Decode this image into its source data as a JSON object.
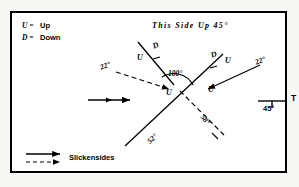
{
  "figure": {
    "title": "This Side Up 45°",
    "background_color": "#ffffff",
    "line_color": "#000000"
  },
  "key": {
    "up_symbol": "U =",
    "up_label": "Up",
    "down_symbol": "D =",
    "down_label": "Down"
  },
  "angles": {
    "center": "100°",
    "left_dashed": "22°",
    "right_solid": "22°",
    "lower_left_solid": "52°",
    "lower_right_dashed": "58°"
  },
  "markers": {
    "upper_left_u": "U",
    "upper_left_d": "D",
    "mid_left_u": "U",
    "upper_right_d": "D",
    "upper_right_u": "U",
    "mid_right_u": "U"
  },
  "scale": {
    "dip_value": "45°",
    "t_symbol": "T"
  },
  "legend": {
    "slickensides_label": "Slickensides"
  }
}
